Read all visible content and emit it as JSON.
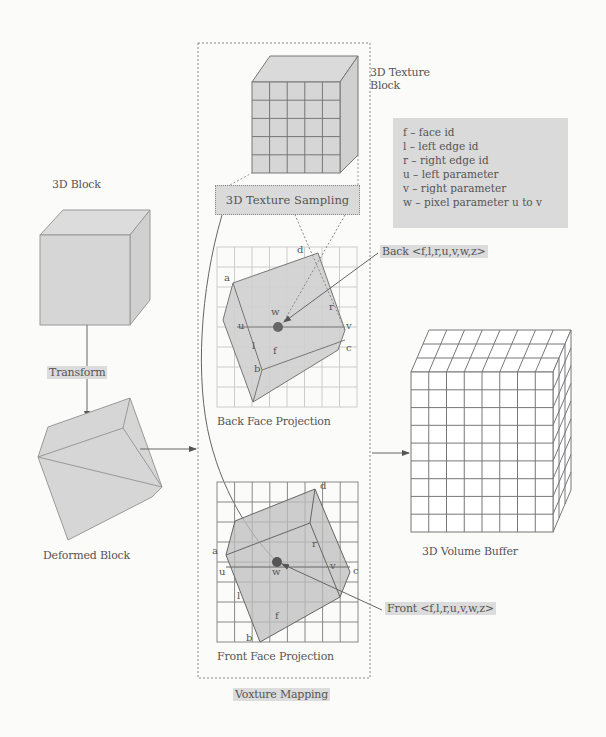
{
  "left_column": {
    "block_label": "3D Block",
    "transform_label": "Transform",
    "deformed_label": "Deformed Block"
  },
  "center_column": {
    "texture_block_label_line1": "3D Texture",
    "texture_block_label_line2": "Block",
    "sampling_label": "3D Texture Sampling",
    "back_face_label": "Back Face Projection",
    "front_face_label": "Front Face Projection",
    "group_label": "Voxture Mapping",
    "back_points": {
      "a": "a",
      "d": "d",
      "r": "r",
      "u": "u",
      "v": "v",
      "w": "w",
      "l": "l",
      "f": "f",
      "b": "b",
      "c": "c"
    },
    "front_points": {
      "a": "a",
      "d": "d",
      "r": "r",
      "u": "u",
      "v": "v",
      "w": "w",
      "l": "l",
      "f": "f",
      "b": "b",
      "c": "c"
    }
  },
  "legend": {
    "items": [
      "f – face id",
      "l – left edge id",
      "r – right edge id",
      "u – left parameter",
      "v – right parameter",
      "w – pixel parameter u to v"
    ]
  },
  "annotations": {
    "back_tuple": "Back <f,l,r,u,v,w,z>",
    "front_tuple": "Front <f,l,r,u,v,w,z>"
  },
  "right_column": {
    "volume_label": "3D Volume Buffer"
  },
  "colors": {
    "face_fill": "#d6d6d6",
    "stroke": "#777777",
    "grid": "#999999",
    "highlight": "#dcdcdc"
  }
}
